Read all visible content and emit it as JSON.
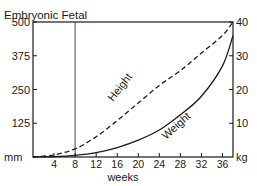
{
  "chart_data": {
    "type": "line",
    "title": "",
    "annotations": [
      "Embryonic",
      "Fetal"
    ],
    "phase_divider_week": 8,
    "xlabel": "weeks",
    "ylabel_left": "mm",
    "ylabel_right": "kg",
    "x_ticks": [
      4,
      8,
      12,
      16,
      20,
      24,
      28,
      32,
      36
    ],
    "y_left_ticks": [
      125,
      250,
      375,
      500
    ],
    "y_right_ticks": [
      10,
      20,
      30,
      40
    ],
    "xlim": [
      0,
      38
    ],
    "ylim_left": [
      0,
      500
    ],
    "ylim_right": [
      0,
      40
    ],
    "grid": false,
    "legend": "inline labels",
    "x": [
      0,
      4,
      8,
      12,
      16,
      20,
      24,
      28,
      32,
      36,
      38
    ],
    "series": [
      {
        "name": "Height",
        "axis": "left",
        "style": "dashed",
        "unit": "mm",
        "values": [
          0,
          8,
          30,
          75,
          135,
          200,
          265,
          320,
          385,
          450,
          500
        ]
      },
      {
        "name": "Weight",
        "axis": "right",
        "style": "solid",
        "unit": "kg",
        "values": [
          0,
          0.1,
          0.5,
          1.3,
          2.8,
          5,
          8,
          12.5,
          18,
          27,
          36
        ]
      }
    ]
  },
  "labels": {
    "header": "Embryonic Fetal",
    "xlabel": "weeks",
    "left_unit": "mm",
    "right_unit": "kg",
    "height_curve": "Height",
    "weight_curve": "Weight"
  }
}
